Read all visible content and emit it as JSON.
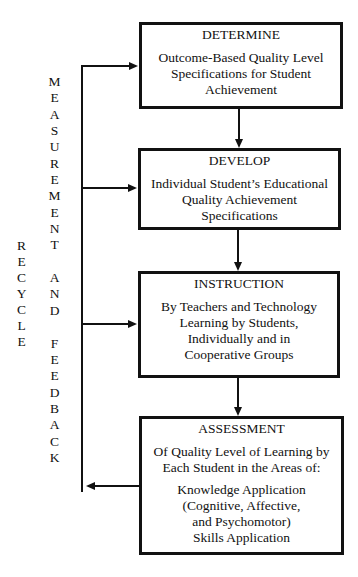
{
  "diagram": {
    "boxes": [
      {
        "title": "DETERMINE",
        "paragraphs": [
          [
            "Outcome-Based Quality Level",
            "Specifications for Student",
            "Achievement"
          ]
        ]
      },
      {
        "title": "DEVELOP",
        "paragraphs": [
          [
            "Individual Student’s Educational",
            "Quality Achievement",
            "Specifications"
          ]
        ]
      },
      {
        "title": "INSTRUCTION",
        "paragraphs": [
          [
            "By Teachers and Technology",
            "Learning by Students,",
            "Individually and in",
            "Cooperative Groups"
          ]
        ]
      },
      {
        "title": "ASSESSMENT",
        "paragraphs": [
          [
            "Of Quality Level of Learning by",
            "Each Student in the Areas of:"
          ],
          [
            "Knowledge Application",
            "(Cognitive, Affective,",
            "and Psychomotor)",
            "Skills Application"
          ]
        ]
      }
    ],
    "feedback_loop": {
      "label_words": [
        "MEASUREMENT",
        "AND",
        "FEEDBACK"
      ],
      "recycle_label": "RECYCLE"
    },
    "colors": {
      "line": "#111111",
      "background": "#ffffff"
    }
  }
}
